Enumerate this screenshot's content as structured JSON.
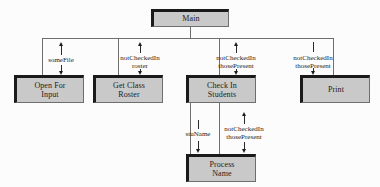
{
  "diagram": {
    "type": "structure-chart",
    "colors": {
      "box_fill": "#c9c9c9",
      "box_border_dark": "#1a1a1a",
      "box_border_light": "#6e6e6e",
      "connector": "#6f6f6f",
      "arrow": "#1c1c1c",
      "background": "#fcfcfc",
      "text": "#1c1c1c"
    },
    "modules": [
      {
        "id": "main",
        "lines": [
          "Main"
        ],
        "level": 0
      },
      {
        "id": "open-input",
        "lines": [
          "Open For",
          "Input"
        ],
        "level": 1
      },
      {
        "id": "get-roster",
        "lines": [
          "Get Class",
          "Roster"
        ],
        "level": 1
      },
      {
        "id": "check-in",
        "lines": [
          "Check In",
          "Students"
        ],
        "level": 1
      },
      {
        "id": "print",
        "lines": [
          "Print"
        ],
        "level": 1
      },
      {
        "id": "process-name",
        "lines": [
          "Process",
          "Name"
        ],
        "level": 2
      }
    ],
    "couples": [
      {
        "id": "c1",
        "from": "open-input",
        "to": "main",
        "direction": "up",
        "lines": [
          "someFile"
        ]
      },
      {
        "id": "c2",
        "from": "open-input",
        "to": "main",
        "direction": "down",
        "lines": []
      },
      {
        "id": "c3",
        "from": "get-roster",
        "to": "main",
        "direction": "up",
        "lines": [
          "notCheckedIn",
          "roster"
        ]
      },
      {
        "id": "c4",
        "from": "check-in",
        "to": "main",
        "direction": "up",
        "lines": [
          "notCheckedIn",
          "thosePresent"
        ]
      },
      {
        "id": "c5",
        "from": "main",
        "to": "print",
        "direction": "down",
        "lines": [
          "notCheckedIn",
          "thosePresent"
        ]
      },
      {
        "id": "c6",
        "from": "check-in",
        "to": "process-name",
        "direction": "down",
        "lines": [
          "stuName"
        ]
      },
      {
        "id": "c7",
        "from": "process-name",
        "to": "check-in",
        "direction": "up",
        "lines": [
          "notCheckedIn",
          "thosePresent"
        ]
      }
    ]
  }
}
